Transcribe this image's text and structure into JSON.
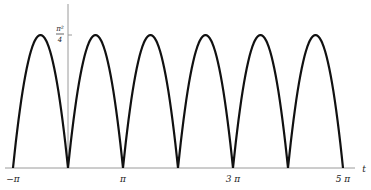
{
  "chart_data": {
    "type": "line",
    "title": "",
    "xlabel": "t",
    "ylabel": "",
    "function": "f(t) = t(π − t) on [0, π], extended periodically with period π",
    "xlim_units_of_pi": [
      -1,
      5
    ],
    "ylim": [
      0,
      2.4674
    ],
    "x_ticks": [
      {
        "value": -1,
        "label": "−π"
      },
      {
        "value": 1,
        "label": "π"
      },
      {
        "value": 3,
        "label": "3 π"
      },
      {
        "value": 5,
        "label": "5 π"
      }
    ],
    "y_ticks": [
      {
        "value": 2.4674,
        "label_num": "π²",
        "label_den": "4"
      }
    ],
    "series": [
      {
        "name": "f(t)",
        "color": "#111111",
        "zeros_units_of_pi": [
          -1,
          0,
          1,
          2,
          3,
          4,
          5
        ],
        "peaks_units_of_pi": [
          -0.5,
          0.5,
          1.5,
          2.5,
          3.5,
          4.5
        ],
        "peak_value": 2.4674
      }
    ],
    "grid": false,
    "legend": null
  },
  "axis": {
    "x_label": "t",
    "y_tick_num": "π²",
    "y_tick_den": "4",
    "x_tick_labels": [
      "−π",
      "π",
      "3 π",
      "5 π"
    ]
  },
  "colors": {
    "curve": "#111111",
    "axis": "#999999"
  }
}
